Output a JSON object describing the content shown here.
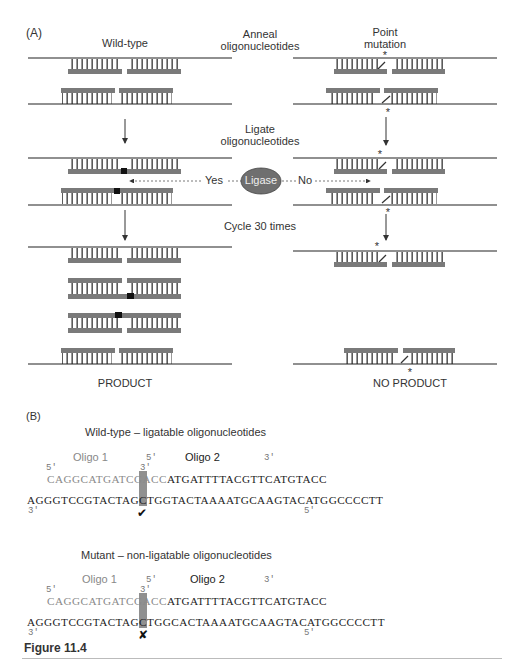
{
  "panel_a": {
    "label": "(A)",
    "wild_type_label": "Wild-type",
    "point_mutation_label_line1": "Point",
    "point_mutation_label_line2": "mutation",
    "step1_line1": "Anneal",
    "step1_line2": "oligonucleotides",
    "step2_line1": "Ligate",
    "step2_line2": "oligonucleotides",
    "ligase_label": "Ligase",
    "yes_label": "Yes",
    "no_label": "No",
    "step3": "Cycle 30 times",
    "product_label": "PRODUCT",
    "no_product_label": "NO PRODUCT",
    "mutation_marker": "*",
    "colors": {
      "strand": "#222222",
      "oligo": "#7a7a7a",
      "ligation_mark": "#111111",
      "ligase_fill": "#6f6f6f"
    }
  },
  "panel_b": {
    "label": "(B)",
    "wild_type": {
      "title": "Wild-type – ligatable oligonucleotides",
      "oligo1_label": "Oligo 1",
      "oligo2_label": "Oligo 2",
      "oligo1_5prime": "5'",
      "oligo1_3prime": "3'",
      "oligo2_5prime": "5'",
      "oligo2_3prime": "3'",
      "oligo1_seq": "CAGGCATGATCGACC",
      "oligo2_seq": "ATGATTTTACGTTCATGTACC",
      "template_left": "AGGGTCCGTACTAGCTGG",
      "template_junction": "T",
      "template_right": "ACTAAAATGCAAGTACATGGCCCCTT",
      "template_3prime": "3'",
      "template_5prime": "5'",
      "result_mark": "✔"
    },
    "mutant": {
      "title": "Mutant – non-ligatable oligonucleotides",
      "oligo1_label": "Oligo 1",
      "oligo2_label": "Oligo 2",
      "oligo1_5prime": "5'",
      "oligo1_3prime": "3'",
      "oligo2_5prime": "5'",
      "oligo2_3prime": "3'",
      "oligo1_seq": "CAGGCATGATCGACC",
      "oligo2_seq": "ATGATTTTACGTTCATGTACC",
      "template_left": "AGGGTCCGTACTAGCTGG",
      "template_junction": "C",
      "template_right": "ACTAAAATGCAAGTACATGGCCCCTT",
      "template_3prime": "3'",
      "template_5prime": "5'",
      "result_mark": "✘"
    },
    "colors": {
      "oligo1_text": "#8a8a8a",
      "oligo2_text": "#222222",
      "junction_highlight": "#7d7d7d"
    }
  },
  "figure_caption": "Figure 11.4"
}
